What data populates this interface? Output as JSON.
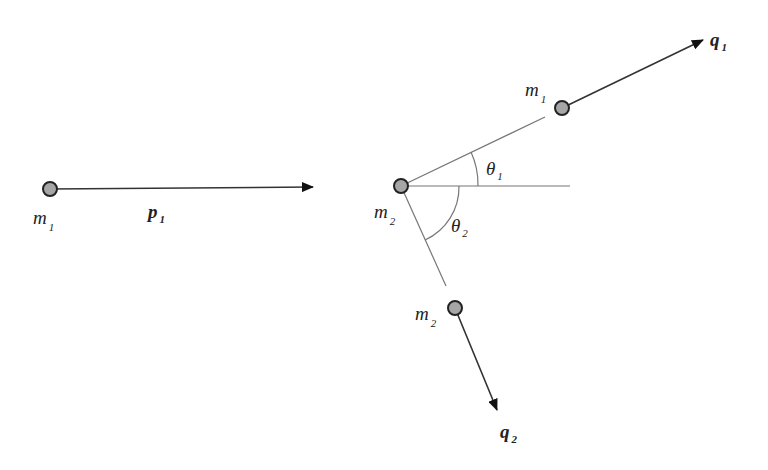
{
  "diagram": {
    "before": {
      "particle_label": "m",
      "particle_sub": "1",
      "momentum_label": "p",
      "momentum_sub": "1"
    },
    "collision_point": {
      "label": "m",
      "sub": "2"
    },
    "after": {
      "particle1": {
        "label": "m",
        "sub": "1",
        "momentum_label": "q",
        "momentum_sub": "1"
      },
      "particle2": {
        "label": "m",
        "sub": "2",
        "momentum_label": "q",
        "momentum_sub": "2"
      }
    },
    "angles": [
      {
        "label": "θ",
        "sub": "1"
      },
      {
        "label": "θ",
        "sub": "2"
      }
    ],
    "colors": {
      "line": "#333333",
      "particle_fill": "#a6a6a6",
      "particle_stroke": "#222222",
      "reference_line": "#777777"
    }
  }
}
